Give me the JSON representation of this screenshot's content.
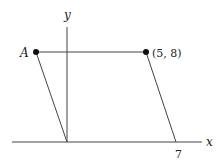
{
  "diagram": {
    "type": "parallelogram-on-axes",
    "axes": {
      "x_label": "x",
      "y_label": "y",
      "x_tick_label": "7"
    },
    "points": {
      "A": {
        "label": "A"
      },
      "B": {
        "label": "(5, 8)"
      }
    },
    "colors": {
      "line": "#444444",
      "point": "#111111",
      "text": "#222222",
      "background": "#ffffff"
    }
  }
}
